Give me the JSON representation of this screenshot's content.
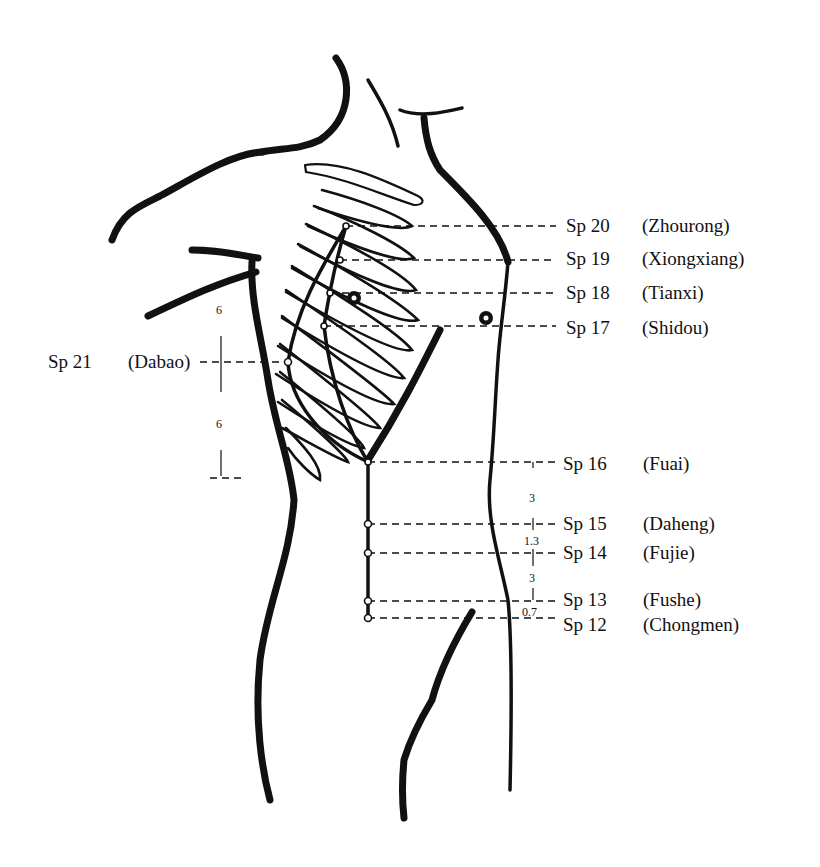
{
  "diagram": {
    "points": [
      {
        "code": "Sp 20",
        "name": "(Zhourong)"
      },
      {
        "code": "Sp 19",
        "name": "(Xiongxiang)"
      },
      {
        "code": "Sp 18",
        "name": "(Tianxi)"
      },
      {
        "code": "Sp 17",
        "name": "(Shidou)"
      },
      {
        "code": "Sp 16",
        "name": "(Fuai)"
      },
      {
        "code": "Sp 15",
        "name": "(Daheng)"
      },
      {
        "code": "Sp 14",
        "name": "(Fujie)"
      },
      {
        "code": "Sp 13",
        "name": "(Fushe)"
      },
      {
        "code": "Sp 12",
        "name": "(Chongmen)"
      },
      {
        "code": "Sp 21",
        "name": "(Dabao)"
      }
    ],
    "measurements": {
      "side_upper": "6",
      "side_lower": "6",
      "abd_16_15": "3",
      "abd_15_14": "1.3",
      "abd_14_13": "3",
      "abd_13_12": "0.7"
    }
  }
}
